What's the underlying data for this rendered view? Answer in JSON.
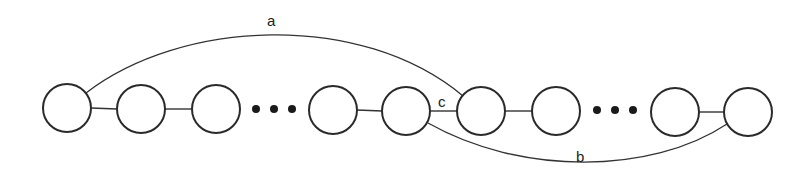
{
  "diagram": {
    "type": "graph",
    "nodes": [
      {
        "id": "n1",
        "cx": 67,
        "cy": 108
      },
      {
        "id": "n2",
        "cx": 141,
        "cy": 109
      },
      {
        "id": "n3",
        "cx": 216,
        "cy": 109
      },
      {
        "id": "n4",
        "cx": 333,
        "cy": 110
      },
      {
        "id": "n5",
        "cx": 406,
        "cy": 111
      },
      {
        "id": "n6",
        "cx": 481,
        "cy": 111
      },
      {
        "id": "n7",
        "cx": 556,
        "cy": 111
      },
      {
        "id": "n8",
        "cx": 675,
        "cy": 112
      },
      {
        "id": "n9",
        "cx": 748,
        "cy": 112
      }
    ],
    "node_radius": 24,
    "ellipses": [
      {
        "after": "n3",
        "before": "n4",
        "symbol": "..."
      },
      {
        "after": "n7",
        "before": "n8",
        "symbol": "..."
      }
    ],
    "edges": [
      {
        "from": "n1",
        "to": "n2"
      },
      {
        "from": "n2",
        "to": "n3"
      },
      {
        "from": "n4",
        "to": "n5"
      },
      {
        "from": "n5",
        "to": "n6",
        "label": "c"
      },
      {
        "from": "n6",
        "to": "n7"
      },
      {
        "from": "n8",
        "to": "n9"
      },
      {
        "from": "n1",
        "to": "n6",
        "label": "a",
        "style": "arc-over"
      },
      {
        "from": "n5",
        "to": "n9",
        "label": "b",
        "style": "arc-under"
      }
    ],
    "labels": {
      "a": "a",
      "b": "b",
      "c": "c"
    }
  }
}
